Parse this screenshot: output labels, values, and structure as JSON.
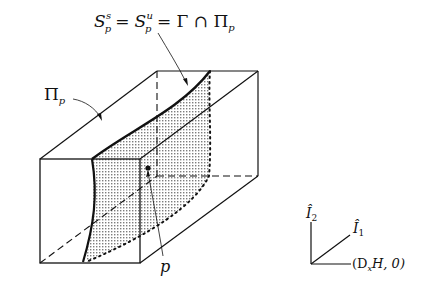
{
  "title_label": {
    "s": "S",
    "sub1": "p",
    "sup1": "s",
    "eq1": "=",
    "sup2": "u",
    "eq2": "= Γ ∩ Π",
    "sub_end": "p"
  },
  "plane_label": {
    "main": "Π",
    "sub": "p"
  },
  "point_label": "p",
  "axes": {
    "i2": "Î",
    "i2_sub": "2",
    "i1": "Î",
    "i1_sub": "1",
    "horizontal": "(D",
    "horizontal_sub": "x",
    "horizontal_rest": "H, 0)"
  },
  "colors": {
    "ink": "#111111",
    "background": "#ffffff",
    "stipple": "#8a8a8a"
  }
}
